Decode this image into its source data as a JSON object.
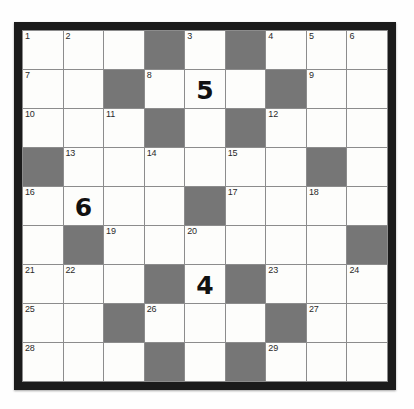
{
  "puzzle": {
    "kind": "crossword-grid",
    "rows": 9,
    "columns": 9,
    "colors": {
      "frame": "#1b1b1b",
      "block": "#767676",
      "cell": "#fdfdfb",
      "gridline": "#8c8c8c",
      "number_text": "#2a2a2a",
      "entry_text": "#111111",
      "page_background": "#ffffff"
    },
    "cells": [
      [
        {
          "number": "1",
          "block": false,
          "entry": ""
        },
        {
          "number": "2",
          "block": false,
          "entry": ""
        },
        {
          "number": "",
          "block": false,
          "entry": ""
        },
        {
          "number": "",
          "block": true,
          "entry": ""
        },
        {
          "number": "3",
          "block": false,
          "entry": ""
        },
        {
          "number": "",
          "block": true,
          "entry": ""
        },
        {
          "number": "4",
          "block": false,
          "entry": ""
        },
        {
          "number": "5",
          "block": false,
          "entry": ""
        },
        {
          "number": "6",
          "block": false,
          "entry": ""
        }
      ],
      [
        {
          "number": "7",
          "block": false,
          "entry": ""
        },
        {
          "number": "",
          "block": false,
          "entry": ""
        },
        {
          "number": "",
          "block": true,
          "entry": ""
        },
        {
          "number": "8",
          "block": false,
          "entry": ""
        },
        {
          "number": "",
          "block": false,
          "entry": "5"
        },
        {
          "number": "",
          "block": false,
          "entry": ""
        },
        {
          "number": "",
          "block": true,
          "entry": ""
        },
        {
          "number": "9",
          "block": false,
          "entry": ""
        },
        {
          "number": "",
          "block": false,
          "entry": ""
        }
      ],
      [
        {
          "number": "10",
          "block": false,
          "entry": ""
        },
        {
          "number": "",
          "block": false,
          "entry": ""
        },
        {
          "number": "11",
          "block": false,
          "entry": ""
        },
        {
          "number": "",
          "block": true,
          "entry": ""
        },
        {
          "number": "",
          "block": false,
          "entry": ""
        },
        {
          "number": "",
          "block": true,
          "entry": ""
        },
        {
          "number": "12",
          "block": false,
          "entry": ""
        },
        {
          "number": "",
          "block": false,
          "entry": ""
        },
        {
          "number": "",
          "block": false,
          "entry": ""
        }
      ],
      [
        {
          "number": "",
          "block": true,
          "entry": ""
        },
        {
          "number": "13",
          "block": false,
          "entry": ""
        },
        {
          "number": "",
          "block": false,
          "entry": ""
        },
        {
          "number": "14",
          "block": false,
          "entry": ""
        },
        {
          "number": "",
          "block": false,
          "entry": ""
        },
        {
          "number": "15",
          "block": false,
          "entry": ""
        },
        {
          "number": "",
          "block": false,
          "entry": ""
        },
        {
          "number": "",
          "block": true,
          "entry": ""
        },
        {
          "number": "",
          "block": false,
          "entry": ""
        }
      ],
      [
        {
          "number": "16",
          "block": false,
          "entry": ""
        },
        {
          "number": "",
          "block": false,
          "entry": "6"
        },
        {
          "number": "",
          "block": false,
          "entry": ""
        },
        {
          "number": "",
          "block": false,
          "entry": ""
        },
        {
          "number": "",
          "block": true,
          "entry": ""
        },
        {
          "number": "17",
          "block": false,
          "entry": ""
        },
        {
          "number": "",
          "block": false,
          "entry": ""
        },
        {
          "number": "18",
          "block": false,
          "entry": ""
        },
        {
          "number": "",
          "block": false,
          "entry": ""
        }
      ],
      [
        {
          "number": "",
          "block": false,
          "entry": ""
        },
        {
          "number": "",
          "block": true,
          "entry": ""
        },
        {
          "number": "19",
          "block": false,
          "entry": ""
        },
        {
          "number": "",
          "block": false,
          "entry": ""
        },
        {
          "number": "20",
          "block": false,
          "entry": ""
        },
        {
          "number": "",
          "block": false,
          "entry": ""
        },
        {
          "number": "",
          "block": false,
          "entry": ""
        },
        {
          "number": "",
          "block": false,
          "entry": ""
        },
        {
          "number": "",
          "block": true,
          "entry": ""
        }
      ],
      [
        {
          "number": "21",
          "block": false,
          "entry": ""
        },
        {
          "number": "22",
          "block": false,
          "entry": ""
        },
        {
          "number": "",
          "block": false,
          "entry": ""
        },
        {
          "number": "",
          "block": true,
          "entry": ""
        },
        {
          "number": "",
          "block": false,
          "entry": "4"
        },
        {
          "number": "",
          "block": true,
          "entry": ""
        },
        {
          "number": "23",
          "block": false,
          "entry": ""
        },
        {
          "number": "",
          "block": false,
          "entry": ""
        },
        {
          "number": "24",
          "block": false,
          "entry": ""
        }
      ],
      [
        {
          "number": "25",
          "block": false,
          "entry": ""
        },
        {
          "number": "",
          "block": false,
          "entry": ""
        },
        {
          "number": "",
          "block": true,
          "entry": ""
        },
        {
          "number": "26",
          "block": false,
          "entry": ""
        },
        {
          "number": "",
          "block": false,
          "entry": ""
        },
        {
          "number": "",
          "block": false,
          "entry": ""
        },
        {
          "number": "",
          "block": true,
          "entry": ""
        },
        {
          "number": "27",
          "block": false,
          "entry": ""
        },
        {
          "number": "",
          "block": false,
          "entry": ""
        }
      ],
      [
        {
          "number": "28",
          "block": false,
          "entry": ""
        },
        {
          "number": "",
          "block": false,
          "entry": ""
        },
        {
          "number": "",
          "block": false,
          "entry": ""
        },
        {
          "number": "",
          "block": true,
          "entry": ""
        },
        {
          "number": "",
          "block": false,
          "entry": ""
        },
        {
          "number": "",
          "block": true,
          "entry": ""
        },
        {
          "number": "29",
          "block": false,
          "entry": ""
        },
        {
          "number": "",
          "block": false,
          "entry": ""
        },
        {
          "number": "",
          "block": false,
          "entry": ""
        }
      ]
    ]
  }
}
